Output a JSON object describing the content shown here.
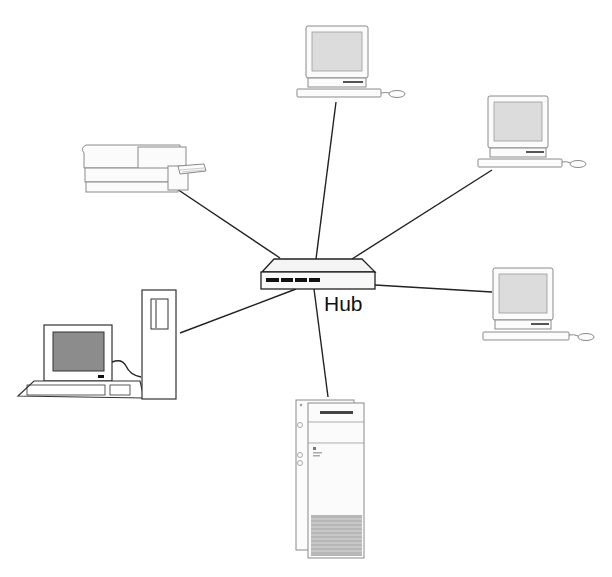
{
  "diagram": {
    "type": "star-network-topology",
    "center": {
      "id": "hub",
      "label": "Hub"
    },
    "nodes": [
      {
        "id": "workstation-top",
        "kind": "desktop-computer",
        "position": "top"
      },
      {
        "id": "workstation-top-right",
        "kind": "desktop-computer",
        "position": "upper-right"
      },
      {
        "id": "workstation-right",
        "kind": "desktop-computer",
        "position": "right"
      },
      {
        "id": "server-tower",
        "kind": "tower-server",
        "position": "bottom"
      },
      {
        "id": "pc-left",
        "kind": "pc-with-tower",
        "position": "left"
      },
      {
        "id": "printer",
        "kind": "laser-printer",
        "position": "upper-left"
      }
    ],
    "edges": [
      {
        "from": "hub",
        "to": "workstation-top"
      },
      {
        "from": "hub",
        "to": "workstation-top-right"
      },
      {
        "from": "hub",
        "to": "workstation-right"
      },
      {
        "from": "hub",
        "to": "server-tower"
      },
      {
        "from": "hub",
        "to": "pc-left"
      },
      {
        "from": "hub",
        "to": "printer"
      }
    ]
  }
}
